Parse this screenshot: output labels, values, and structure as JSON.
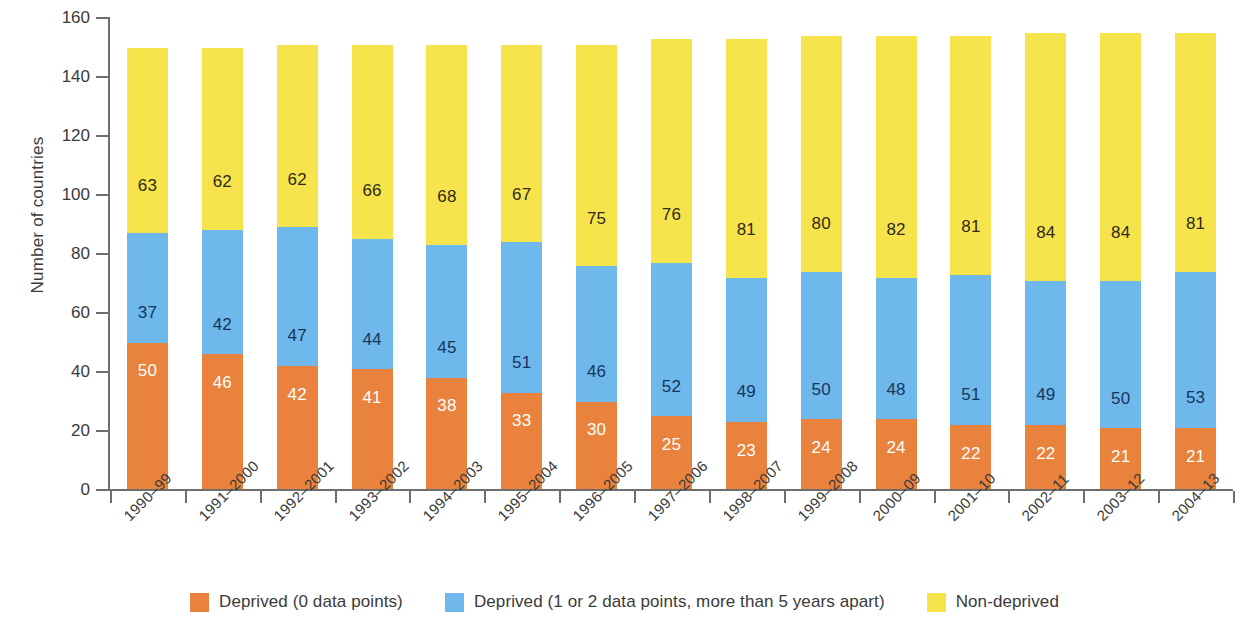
{
  "chart_data": {
    "type": "bar",
    "stacked": true,
    "title": "",
    "xlabel": "",
    "ylabel": "Number of countries",
    "ylim": [
      0,
      160
    ],
    "ytick_step": 20,
    "yticks": [
      0,
      20,
      40,
      60,
      80,
      100,
      120,
      140,
      160
    ],
    "grid": false,
    "legend_position": "bottom",
    "categories": [
      "1990–99",
      "1991–2000",
      "1992–2001",
      "1993–2002",
      "1994–2003",
      "1995–2004",
      "1996–2005",
      "1997–2006",
      "1998–2007",
      "1999–2008",
      "2000–09",
      "2001–10",
      "2002–11",
      "2003–12",
      "2004–13"
    ],
    "series": [
      {
        "name": "Deprived (0 data points)",
        "color": "#E8823C",
        "label_color": "#ffffff",
        "values": [
          50,
          46,
          42,
          41,
          38,
          33,
          30,
          25,
          23,
          24,
          24,
          22,
          22,
          21,
          21
        ]
      },
      {
        "name": "Deprived (1 or 2 data points, more than 5 years apart)",
        "color": "#6FB8EB",
        "label_color": "#16355c",
        "values": [
          37,
          42,
          47,
          44,
          45,
          51,
          46,
          52,
          49,
          50,
          48,
          51,
          49,
          50,
          53
        ]
      },
      {
        "name": "Non-deprived",
        "color": "#F7E44C",
        "label_color": "#2f2a16",
        "values": [
          63,
          62,
          62,
          66,
          68,
          67,
          75,
          76,
          81,
          80,
          82,
          81,
          84,
          84,
          81
        ]
      }
    ],
    "totals": [
      150,
      150,
      151,
      151,
      151,
      151,
      151,
      153,
      153,
      154,
      154,
      154,
      155,
      155,
      155
    ]
  },
  "legend": {
    "items": [
      {
        "label": "Deprived (0 data points)",
        "color": "#E8823C"
      },
      {
        "label": "Deprived (1 or 2 data points, more than 5 years apart)",
        "color": "#6FB8EB"
      },
      {
        "label": "Non-deprived",
        "color": "#F7E44C"
      }
    ]
  }
}
